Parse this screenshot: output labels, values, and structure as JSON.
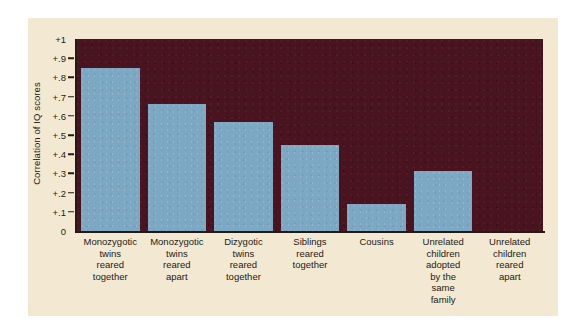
{
  "chart_data": {
    "type": "bar",
    "title": "",
    "xlabel": "",
    "ylabel": "Correlation of IQ scores",
    "ylim": [
      0,
      1
    ],
    "ytick_labels": [
      "+1",
      "+.9",
      "+.8",
      "+.7",
      "+.6",
      "+.5",
      "+.4",
      "+.3",
      "+.2",
      "+.1",
      "0"
    ],
    "ytick_values": [
      1,
      0.9,
      0.8,
      0.7,
      0.6,
      0.5,
      0.4,
      0.3,
      0.2,
      0.1,
      0
    ],
    "grid": false,
    "legend": "none",
    "categories": [
      "Monozygotic twins reared together",
      "Monozygotic twins reared apart",
      "Dizygotic twins reared together",
      "Siblings reared together",
      "Cousins",
      "Unrelated children adopted by the same family",
      "Unrelated children reared apart"
    ],
    "category_lines": [
      [
        "Monozygotic",
        "twins",
        "reared",
        "together"
      ],
      [
        "Monozygotic",
        "twins",
        "reared",
        "apart"
      ],
      [
        "Dizygotic",
        "twins",
        "reared",
        "together"
      ],
      [
        "Siblings",
        "reared",
        "together"
      ],
      [
        "Cousins"
      ],
      [
        "Unrelated",
        "children",
        "adopted",
        "by the",
        "same",
        "family"
      ],
      [
        "Unrelated",
        "children",
        "reared",
        "apart"
      ]
    ],
    "values": [
      0.85,
      0.66,
      0.57,
      0.45,
      0.14,
      0.31,
      0.0
    ]
  },
  "colors": {
    "panel_background": "#f3e9d2",
    "plot_background": "#491420",
    "bar": "#7da8c4",
    "axis": "#231a14",
    "text": "#231a14",
    "page_background": "#ffffff"
  }
}
